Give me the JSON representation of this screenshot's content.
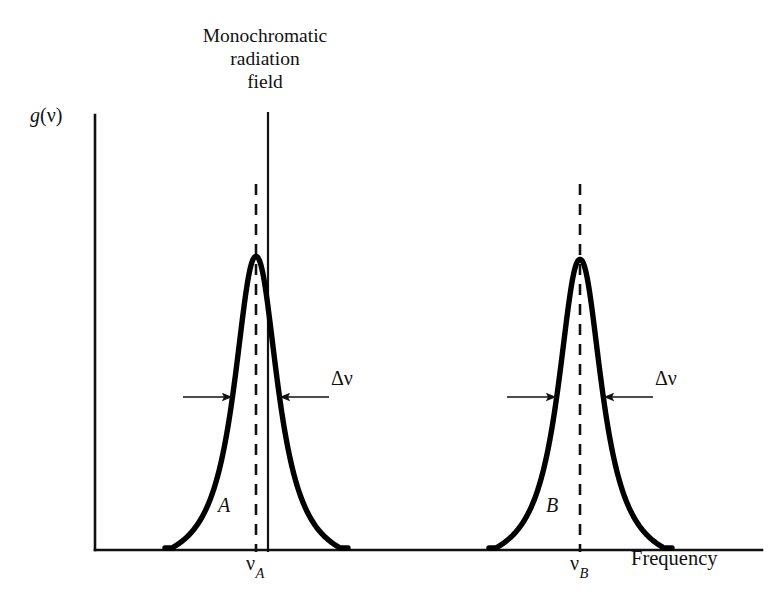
{
  "figure": {
    "title_annotation": {
      "lines": [
        "Monochromatic",
        "radiation",
        "field"
      ]
    },
    "axes": {
      "y_label": "g(ν)",
      "y_label_function": "g",
      "y_label_variable": "ν",
      "x_label": "Frequency",
      "x_axis_name": "frequency-axis",
      "y_axis_name": "intensity-axis",
      "origin": [
        95,
        550
      ],
      "x_axis_end": [
        762,
        550
      ],
      "y_axis_top": [
        95,
        115
      ]
    },
    "tick_labels": [
      {
        "name": "nu-a",
        "text": "ν",
        "subscript": "A",
        "x": 256
      },
      {
        "name": "nu-b",
        "text": "ν",
        "subscript": "B",
        "x": 580
      }
    ],
    "curves": [
      {
        "name": "curve-a",
        "label": "A",
        "center_x": 256,
        "peak_y": 252,
        "baseline_y": 548,
        "half_width": 26,
        "x_start": 165,
        "x_end": 348,
        "label_x": 218,
        "label_y": 494
      },
      {
        "name": "curve-b",
        "label": "B",
        "center_x": 580,
        "peak_y": 255,
        "baseline_y": 548,
        "half_width": 26,
        "x_start": 489,
        "x_end": 672,
        "label_x": 546,
        "label_y": 494
      }
    ],
    "markers": {
      "monochromatic_line": {
        "x": 268,
        "y_top": 112,
        "y_bottom": 552
      },
      "dashed_lines": [
        {
          "name": "center-line-a",
          "x": 256,
          "y_top": 184,
          "y_bottom": 552
        },
        {
          "name": "center-line-b",
          "x": 580,
          "y_top": 184,
          "y_bottom": 552
        }
      ]
    },
    "width_annotations": [
      {
        "name": "linewidth-a",
        "label": "Δν",
        "y": 397,
        "left_line_x1": 183,
        "left_line_x2": 232,
        "right_line_x1": 329,
        "right_line_x2": 280,
        "label_x": 331,
        "label_y": 367
      },
      {
        "name": "linewidth-b",
        "label": "Δν",
        "y": 397,
        "left_line_x1": 507,
        "left_line_x2": 556,
        "right_line_x1": 653,
        "right_line_x2": 604,
        "label_x": 655,
        "label_y": 367
      }
    ],
    "colors": {
      "ink": "#111111",
      "curve": "#000000",
      "background": "#ffffff"
    }
  },
  "chart_data": {
    "type": "line",
    "title": "",
    "xlabel": "Frequency",
    "ylabel": "g(ν)",
    "xticks": [
      "ν_A",
      "ν_B"
    ],
    "grid": false,
    "legend": "none",
    "annotations": [
      "Monochromatic radiation field",
      "Δν",
      "Δν",
      "A",
      "B"
    ],
    "series": [
      {
        "name": "A",
        "shape": "lorentzian",
        "center": "ν_A",
        "peak_height": 1.0,
        "fwhm_label": "Δν"
      },
      {
        "name": "B",
        "shape": "lorentzian",
        "center": "ν_B",
        "peak_height": 1.0,
        "fwhm_label": "Δν"
      }
    ],
    "vertical_markers": [
      {
        "label": "Monochromatic radiation field",
        "style": "solid",
        "x": "slightly above ν_A"
      },
      {
        "label": "ν_A",
        "style": "dashed"
      },
      {
        "label": "ν_B",
        "style": "dashed"
      }
    ]
  }
}
